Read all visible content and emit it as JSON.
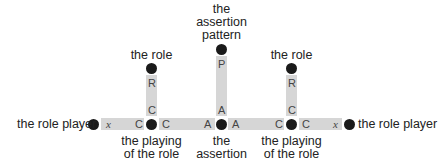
{
  "diagram": {
    "type": "role-assertion structure",
    "nodes": {
      "left_role_player": "the role player",
      "left_role": "the role",
      "left_playing": [
        "the playing",
        "of the role"
      ],
      "assertion_pattern": [
        "the",
        "assertion",
        "pattern"
      ],
      "assertion": [
        "the",
        "assertion"
      ],
      "right_role": "the role",
      "right_playing": [
        "the playing",
        "of the role"
      ],
      "right_role_player": "the role player"
    },
    "edges": {
      "left_player_edge": {
        "from_end": "x",
        "to_end": "C"
      },
      "left_role_edge": {
        "top_end": "R",
        "bottom_end": "C"
      },
      "left_assertion_edge": {
        "from_end": "C",
        "to_end": "A"
      },
      "pattern_edge": {
        "top_end": "P",
        "bottom_end": "A"
      },
      "right_assertion_edge": {
        "from_end": "A",
        "to_end": "C"
      },
      "right_role_edge": {
        "top_end": "R",
        "bottom_end": "C"
      },
      "right_player_edge": {
        "from_end": "C",
        "to_end": "x"
      }
    },
    "colors": {
      "bar": "#d6d6d6",
      "dot": "#1a1a1a",
      "text": "#222222"
    }
  }
}
